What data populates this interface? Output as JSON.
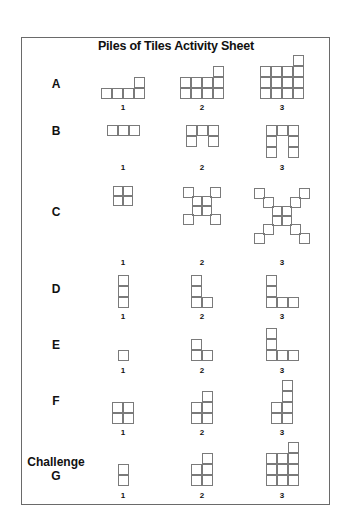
{
  "title": "Piles of Tiles Activity Sheet",
  "tile_size": 11,
  "diag_step": 9,
  "column_centers": [
    123,
    202,
    282
  ],
  "rows": [
    {
      "id": "A",
      "label": "A",
      "label_y": 77,
      "num_y": 103,
      "figures": [
        {
          "num": "1",
          "type": "columns",
          "bottom": 99,
          "heights": [
            1,
            1,
            1,
            2
          ]
        },
        {
          "num": "2",
          "type": "columns",
          "bottom": 99,
          "heights": [
            2,
            2,
            2,
            3
          ]
        },
        {
          "num": "3",
          "type": "columns",
          "bottom": 99,
          "heights": [
            3,
            3,
            3,
            4
          ]
        }
      ]
    },
    {
      "id": "B",
      "label": "B",
      "label_y": 124,
      "num_y": 163,
      "figures": [
        {
          "num": "1",
          "type": "hangers",
          "top": 125,
          "width": 3,
          "legs": 0
        },
        {
          "num": "2",
          "type": "hangers",
          "top": 125,
          "width": 3,
          "legs": 1
        },
        {
          "num": "3",
          "type": "hangers",
          "top": 125,
          "width": 3,
          "legs": 2
        }
      ]
    },
    {
      "id": "C",
      "label": "C",
      "label_y": 205,
      "num_y": 258,
      "figures": [
        {
          "num": "1",
          "type": "cross",
          "center_y": 196,
          "arm": 1
        },
        {
          "num": "2",
          "type": "cross",
          "center_y": 206,
          "arm": 2
        },
        {
          "num": "3",
          "type": "cross",
          "center_y": 216,
          "arm": 3
        }
      ]
    },
    {
      "id": "D",
      "label": "D",
      "label_y": 282,
      "num_y": 312,
      "figures": [
        {
          "num": "1",
          "type": "ell",
          "bottom": 308,
          "up": 3,
          "right": 0
        },
        {
          "num": "2",
          "type": "ell",
          "bottom": 308,
          "up": 3,
          "right": 1
        },
        {
          "num": "3",
          "type": "ell",
          "bottom": 308,
          "up": 3,
          "right": 2
        }
      ]
    },
    {
      "id": "E",
      "label": "E",
      "label_y": 338,
      "num_y": 366,
      "figures": [
        {
          "num": "1",
          "type": "ell",
          "bottom": 361,
          "up": 1,
          "right": 0
        },
        {
          "num": "2",
          "type": "ell",
          "bottom": 361,
          "up": 2,
          "right": 1
        },
        {
          "num": "3",
          "type": "ell",
          "bottom": 361,
          "up": 3,
          "right": 2
        }
      ]
    },
    {
      "id": "F",
      "label": "F",
      "label_y": 394,
      "num_y": 428,
      "figures": [
        {
          "num": "1",
          "type": "columns",
          "bottom": 424,
          "heights": [
            2,
            2
          ]
        },
        {
          "num": "2",
          "type": "columns",
          "bottom": 424,
          "heights": [
            2,
            3
          ]
        },
        {
          "num": "3",
          "type": "columns",
          "bottom": 424,
          "heights": [
            2,
            4
          ]
        }
      ]
    },
    {
      "id": "G",
      "label": "Challenge",
      "sublabel": "G",
      "label_y": 455,
      "num_y": 491,
      "figures": [
        {
          "num": "1",
          "type": "columns",
          "bottom": 486,
          "heights": [
            2
          ]
        },
        {
          "num": "2",
          "type": "columns",
          "bottom": 486,
          "heights": [
            2,
            3
          ]
        },
        {
          "num": "3",
          "type": "columns",
          "bottom": 486,
          "heights": [
            3,
            3,
            4
          ]
        }
      ]
    }
  ]
}
